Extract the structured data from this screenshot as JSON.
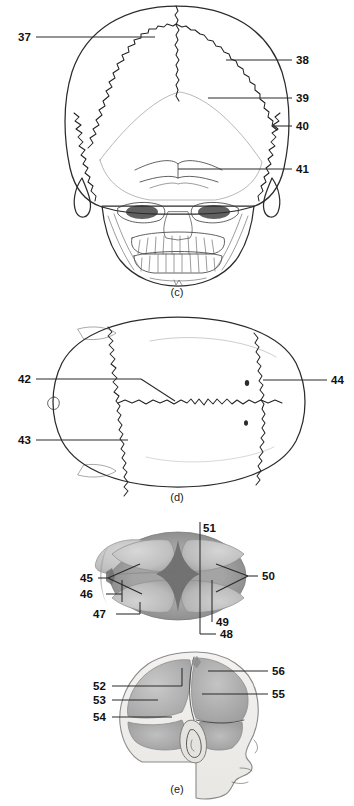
{
  "figure": {
    "background_color": "#ffffff",
    "line_color": "#2b2b2b",
    "label_color": "#111111"
  },
  "panels": [
    {
      "id": "c",
      "caption": "(c)",
      "view": "posterior view of adult skull",
      "labels": [
        {
          "number": "37",
          "side": "left",
          "x": 18,
          "y": 40
        },
        {
          "number": "38",
          "side": "right",
          "x": 296,
          "y": 63
        },
        {
          "number": "39",
          "side": "right",
          "x": 296,
          "y": 101
        },
        {
          "number": "40",
          "side": "right",
          "x": 296,
          "y": 129
        },
        {
          "number": "41",
          "side": "right",
          "x": 296,
          "y": 172
        }
      ]
    },
    {
      "id": "d",
      "caption": "(d)",
      "view": "superior view of adult skull",
      "labels": [
        {
          "number": "42",
          "side": "left",
          "x": 18,
          "y": 379
        },
        {
          "number": "43",
          "side": "left",
          "x": 18,
          "y": 440
        },
        {
          "number": "44",
          "side": "right",
          "x": 330,
          "y": 380
        }
      ]
    },
    {
      "id": "e-superior",
      "caption": "",
      "view": "superior view of fetal skull",
      "labels": [
        {
          "number": "45",
          "side": "left",
          "x": 88,
          "y": 578
        },
        {
          "number": "46",
          "side": "left",
          "x": 88,
          "y": 594
        },
        {
          "number": "47",
          "side": "left",
          "x": 99,
          "y": 613
        },
        {
          "number": "48",
          "side": "bottom",
          "x": 222,
          "y": 634
        },
        {
          "number": "49",
          "side": "bottom",
          "x": 222,
          "y": 621
        },
        {
          "number": "50",
          "side": "right",
          "x": 250,
          "y": 576
        },
        {
          "number": "51",
          "side": "top",
          "x": 203,
          "y": 528
        }
      ]
    },
    {
      "id": "e",
      "caption": "(e)",
      "view": "lateral view of fetal skull",
      "labels": [
        {
          "number": "52",
          "side": "left",
          "x": 93,
          "y": 686
        },
        {
          "number": "53",
          "side": "left",
          "x": 93,
          "y": 700
        },
        {
          "number": "54",
          "side": "left",
          "x": 93,
          "y": 717
        },
        {
          "number": "55",
          "side": "right",
          "x": 272,
          "y": 694
        },
        {
          "number": "56",
          "side": "right",
          "x": 272,
          "y": 671
        }
      ]
    }
  ],
  "colors": {
    "bone_fill": "#f2f1ee",
    "bone_fill_shaded": "#e9e8e4",
    "fetal_plate_light": "#c9c9c9",
    "fetal_plate_mid": "#b3b3b3",
    "fetal_plate_dark": "#9a9a9a",
    "fetal_rim": "#8d8d8d",
    "outline": "#2b2b2b",
    "leader": "#2a2a2a"
  }
}
